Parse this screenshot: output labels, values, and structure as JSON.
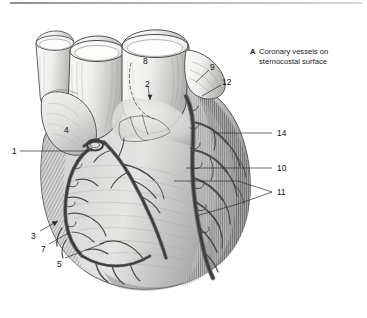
{
  "figure": {
    "panel_letter": "A",
    "caption_line1": "Coronary vessels on",
    "caption_line2": "sternocostal surface",
    "style": "grayscale-engraving",
    "background_color": "#ffffff",
    "ink_color": "#3a3a3a",
    "top_rule_color": "#9a9a9a"
  },
  "labels": [
    {
      "id": "label-1",
      "text": "1",
      "x": 12,
      "y": 147,
      "side": "left"
    },
    {
      "id": "label-2",
      "text": "2",
      "x": 145,
      "y": 80,
      "side": "center"
    },
    {
      "id": "label-3",
      "text": "3",
      "x": 31,
      "y": 232,
      "side": "left"
    },
    {
      "id": "label-4",
      "text": "4",
      "x": 64,
      "y": 126,
      "side": "center"
    },
    {
      "id": "label-5",
      "text": "5",
      "x": 57,
      "y": 260,
      "side": "left"
    },
    {
      "id": "label-7",
      "text": "7",
      "x": 41,
      "y": 245,
      "side": "left"
    },
    {
      "id": "label-8",
      "text": "8",
      "x": 143,
      "y": 57,
      "side": "center"
    },
    {
      "id": "label-9",
      "text": "9",
      "x": 210,
      "y": 63,
      "side": "right"
    },
    {
      "id": "label-10",
      "text": "10",
      "x": 277,
      "y": 164,
      "side": "right"
    },
    {
      "id": "label-11",
      "text": "11",
      "x": 277,
      "y": 188,
      "side": "right"
    },
    {
      "id": "label-12",
      "text": "12",
      "x": 222,
      "y": 78,
      "side": "right"
    },
    {
      "id": "label-14",
      "text": "14",
      "x": 277,
      "y": 129,
      "side": "right"
    }
  ]
}
